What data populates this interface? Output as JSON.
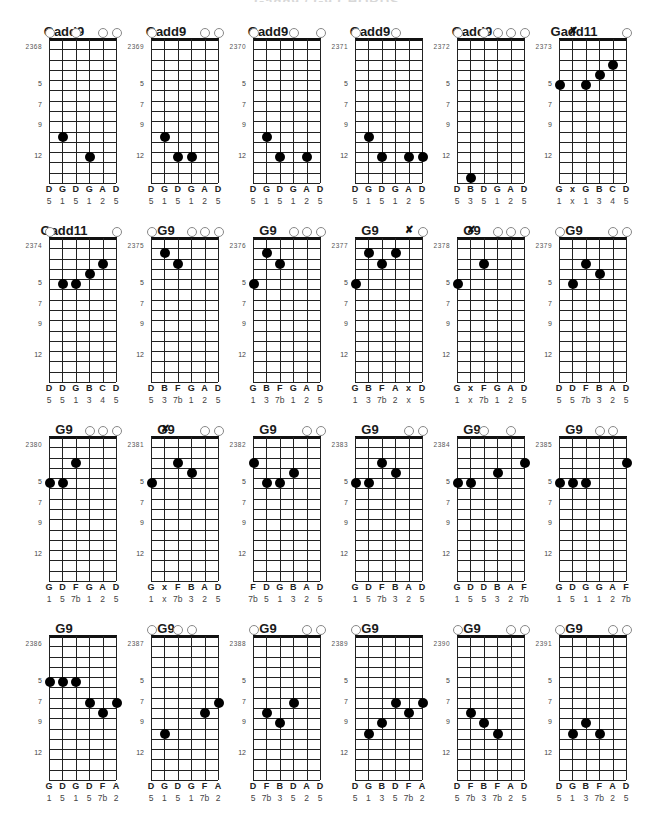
{
  "page": {
    "title": "Gadd9 / G9 CHORDS"
  },
  "layout": {
    "columns": 6,
    "col_pitch": 102,
    "row_pitch": 199,
    "origin_x": 0,
    "origin_y": 32,
    "frets_shown": 14,
    "fret_labels": [
      5,
      7,
      9,
      12
    ]
  },
  "chart_data": {
    "type": "table",
    "string_count": 6,
    "fret_markers": [
      "5",
      "7",
      "9",
      "12"
    ],
    "chords": [
      {
        "id": "2368",
        "name": "Gadd9",
        "strings": [
          "o",
          "10",
          "o",
          "12",
          "o",
          "o"
        ],
        "notes": [
          "D",
          "G",
          "D",
          "G",
          "A",
          "D"
        ],
        "degrees": [
          "5",
          "1",
          "5",
          "1",
          "2",
          "5"
        ]
      },
      {
        "id": "2369",
        "name": "Gadd9",
        "strings": [
          "o",
          "10",
          "12",
          "12",
          "o",
          "o"
        ],
        "notes": [
          "D",
          "G",
          "D",
          "G",
          "A",
          "D"
        ],
        "degrees": [
          "5",
          "1",
          "5",
          "1",
          "2",
          "5"
        ]
      },
      {
        "id": "2370",
        "name": "Gadd9",
        "strings": [
          "o",
          "10",
          "12",
          "o",
          "12",
          "o"
        ],
        "notes": [
          "D",
          "G",
          "D",
          "G",
          "A",
          "D"
        ],
        "degrees": [
          "5",
          "1",
          "5",
          "1",
          "2",
          "5"
        ]
      },
      {
        "id": "2371",
        "name": "Gadd9",
        "strings": [
          "o",
          "10",
          "12",
          "o",
          "12",
          "12"
        ],
        "notes": [
          "D",
          "G",
          "D",
          "G",
          "A",
          "D"
        ],
        "degrees": [
          "5",
          "1",
          "5",
          "1",
          "2",
          "5"
        ]
      },
      {
        "id": "2372",
        "name": "Gadd9",
        "strings": [
          "o",
          "14",
          "o",
          "o",
          "o",
          "o"
        ],
        "notes": [
          "D",
          "B",
          "D",
          "G",
          "A",
          "D"
        ],
        "degrees": [
          "5",
          "3",
          "5",
          "1",
          "2",
          "5"
        ]
      },
      {
        "id": "2373",
        "name": "Gadd11",
        "strings": [
          "5",
          "x",
          "5",
          "4",
          "3",
          "o"
        ],
        "notes": [
          "G",
          "x",
          "G",
          "B",
          "C",
          "D"
        ],
        "degrees": [
          "1",
          "x",
          "1",
          "3",
          "4",
          "5"
        ]
      },
      {
        "id": "2374",
        "name": "Gadd11",
        "strings": [
          "o",
          "5",
          "5",
          "4",
          "3",
          "o"
        ],
        "notes": [
          "D",
          "D",
          "G",
          "B",
          "C",
          "D"
        ],
        "degrees": [
          "5",
          "5",
          "1",
          "3",
          "4",
          "5"
        ]
      },
      {
        "id": "2375",
        "name": "G9",
        "strings": [
          "o",
          "2",
          "3",
          "o",
          "o",
          "o"
        ],
        "notes": [
          "D",
          "B",
          "F",
          "G",
          "A",
          "D"
        ],
        "degrees": [
          "5",
          "3",
          "7b",
          "1",
          "2",
          "5"
        ]
      },
      {
        "id": "2376",
        "name": "G9",
        "strings": [
          "5",
          "2",
          "3",
          "o",
          "o",
          "o"
        ],
        "notes": [
          "G",
          "B",
          "F",
          "G",
          "A",
          "D"
        ],
        "degrees": [
          "1",
          "3",
          "7b",
          "1",
          "2",
          "5"
        ]
      },
      {
        "id": "2377",
        "name": "G9",
        "strings": [
          "5",
          "2",
          "3",
          "2",
          "x",
          "o"
        ],
        "notes": [
          "G",
          "B",
          "F",
          "A",
          "x",
          "D"
        ],
        "degrees": [
          "1",
          "3",
          "7b",
          "2",
          "x",
          "5"
        ]
      },
      {
        "id": "2378",
        "name": "G9",
        "strings": [
          "5",
          "x",
          "3",
          "o",
          "o",
          "o"
        ],
        "notes": [
          "G",
          "x",
          "F",
          "G",
          "A",
          "D"
        ],
        "degrees": [
          "1",
          "x",
          "7b",
          "1",
          "2",
          "5"
        ]
      },
      {
        "id": "2379",
        "name": "G9",
        "strings": [
          "o",
          "5",
          "3",
          "4",
          "o",
          "o"
        ],
        "notes": [
          "D",
          "D",
          "F",
          "B",
          "A",
          "D"
        ],
        "degrees": [
          "5",
          "5",
          "7b",
          "3",
          "2",
          "5"
        ]
      },
      {
        "id": "2380",
        "name": "G9",
        "strings": [
          "5",
          "5",
          "3",
          "o",
          "o",
          "o"
        ],
        "notes": [
          "G",
          "D",
          "F",
          "G",
          "A",
          "D"
        ],
        "degrees": [
          "1",
          "5",
          "7b",
          "1",
          "2",
          "5"
        ]
      },
      {
        "id": "2381",
        "name": "G9",
        "strings": [
          "5",
          "x",
          "3",
          "4",
          "o",
          "o"
        ],
        "notes": [
          "G",
          "x",
          "F",
          "B",
          "A",
          "D"
        ],
        "degrees": [
          "1",
          "x",
          "7b",
          "3",
          "2",
          "5"
        ]
      },
      {
        "id": "2382",
        "name": "G9",
        "strings": [
          "3",
          "5",
          "5",
          "4",
          "o",
          "o"
        ],
        "notes": [
          "F",
          "D",
          "G",
          "B",
          "A",
          "D"
        ],
        "degrees": [
          "7b",
          "5",
          "1",
          "3",
          "2",
          "5"
        ]
      },
      {
        "id": "2383",
        "name": "G9",
        "strings": [
          "5",
          "5",
          "3",
          "4",
          "o",
          "o"
        ],
        "notes": [
          "G",
          "D",
          "F",
          "B",
          "A",
          "D"
        ],
        "degrees": [
          "1",
          "5",
          "7b",
          "3",
          "2",
          "5"
        ]
      },
      {
        "id": "2384",
        "name": "G9",
        "strings": [
          "5",
          "5",
          "o",
          "4",
          "o",
          "3"
        ],
        "notes": [
          "G",
          "D",
          "D",
          "B",
          "A",
          "F"
        ],
        "degrees": [
          "1",
          "5",
          "5",
          "3",
          "2",
          "7b"
        ]
      },
      {
        "id": "2385",
        "name": "G9",
        "strings": [
          "5",
          "5",
          "5",
          "o",
          "o",
          "3"
        ],
        "notes": [
          "G",
          "D",
          "G",
          "G",
          "A",
          "F"
        ],
        "degrees": [
          "1",
          "5",
          "1",
          "1",
          "2",
          "7b"
        ]
      },
      {
        "id": "2386",
        "name": "G9",
        "strings": [
          "5",
          "5",
          "5",
          "7",
          "8",
          "7"
        ],
        "notes": [
          "G",
          "D",
          "G",
          "D",
          "F",
          "A"
        ],
        "degrees": [
          "1",
          "5",
          "1",
          "5",
          "7b",
          "2"
        ]
      },
      {
        "id": "2387",
        "name": "G9",
        "strings": [
          "o",
          "10",
          "o",
          "o",
          "8",
          "7"
        ],
        "notes": [
          "D",
          "G",
          "D",
          "G",
          "F",
          "A"
        ],
        "degrees": [
          "5",
          "1",
          "5",
          "1",
          "7b",
          "2"
        ]
      },
      {
        "id": "2388",
        "name": "G9",
        "strings": [
          "o",
          "8",
          "9",
          "7",
          "o",
          "o"
        ],
        "notes": [
          "D",
          "F",
          "B",
          "D",
          "A",
          "D"
        ],
        "degrees": [
          "5",
          "7b",
          "3",
          "5",
          "2",
          "5"
        ]
      },
      {
        "id": "2389",
        "name": "G9",
        "strings": [
          "o",
          "10",
          "9",
          "7",
          "8",
          "7"
        ],
        "notes": [
          "D",
          "G",
          "B",
          "D",
          "F",
          "A"
        ],
        "degrees": [
          "5",
          "1",
          "3",
          "5",
          "7b",
          "2"
        ]
      },
      {
        "id": "2390",
        "name": "G9",
        "strings": [
          "o",
          "8",
          "9",
          "10",
          "o",
          "o"
        ],
        "notes": [
          "D",
          "F",
          "B",
          "F",
          "A",
          "D"
        ],
        "degrees": [
          "5",
          "7b",
          "3",
          "7b",
          "2",
          "5"
        ]
      },
      {
        "id": "2391",
        "name": "G9",
        "strings": [
          "o",
          "10",
          "9",
          "10",
          "o",
          "o"
        ],
        "notes": [
          "D",
          "G",
          "B",
          "F",
          "A",
          "D"
        ],
        "degrees": [
          "5",
          "1",
          "3",
          "7b",
          "2",
          "5"
        ]
      }
    ]
  }
}
